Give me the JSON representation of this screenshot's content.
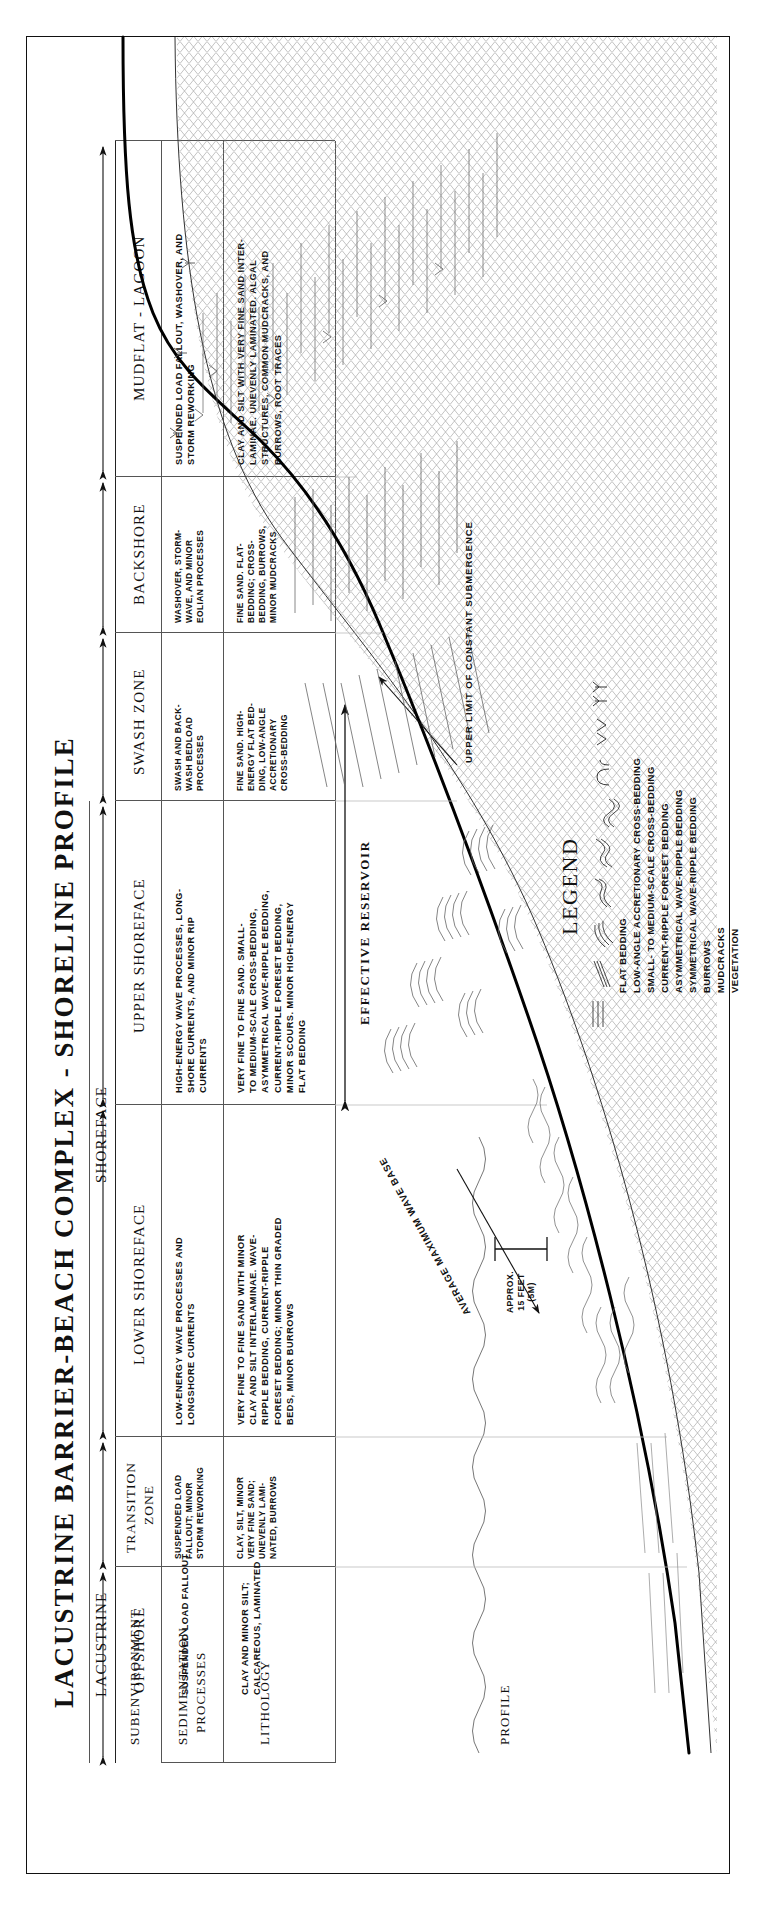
{
  "title": "LACUSTRINE BARRIER-BEACH COMPLEX - SHORELINE PROFILE",
  "row_labels": {
    "subenvironment": "SUBENVIRONMENT",
    "sedimentation_line1": "SEDIMENTATION",
    "sedimentation_line2": "PROCESSES",
    "lithology": "LITHOLOGY",
    "profile": "PROFILE"
  },
  "group_headers": {
    "lacustrine": "LACUSTRINE",
    "shoreface": "SHOREFACE"
  },
  "columns": [
    {
      "id": "offshore",
      "subenvironment": "OFFSHORE",
      "processes": [
        "SUSPENDED LOAD FALLOUT"
      ],
      "lithology": [
        "CLAY AND MINOR SILT;",
        "CALCAREOUS, LAMINATED"
      ]
    },
    {
      "id": "transition-zone",
      "subenvironment": "TRANSITION\nZONE",
      "processes": [
        "SUSPENDED LOAD",
        "FALLOUT; MINOR",
        "STORM REWORKING"
      ],
      "lithology": [
        "CLAY, SILT, MINOR",
        "VERY FINE SAND;",
        "UNEVENLY LAMI-",
        "NATED, BURROWS"
      ]
    },
    {
      "id": "lower-shoreface",
      "subenvironment": "LOWER SHOREFACE",
      "processes": [
        "LOW-ENERGY WAVE PROCESSES AND",
        "LONGSHORE CURRENTS"
      ],
      "lithology": [
        "VERY FINE TO FINE SAND WITH MINOR",
        "CLAY AND SILT INTERLAMINAE. WAVE-",
        "RIPPLE BEDDING, CURRENT-RIPPLE",
        "FORESET BEDDING; MINOR THIN GRADED",
        "BEDS, MINOR BURROWS"
      ]
    },
    {
      "id": "upper-shoreface",
      "subenvironment": "UPPER SHOREFACE",
      "processes": [
        "HIGH-ENERGY WAVE PROCESSES, LONG-",
        "SHORE CURRENTS, AND MINOR RIP",
        "CURRENTS"
      ],
      "lithology": [
        "VERY FINE TO FINE SAND. SMALL-",
        "TO MEDIUM-SCALE CROSS-BEDDING,",
        "ASYMMETRICAL WAVE-RIPPLE BEDDING,",
        "CURRENT-RIPPLE FORESET BEDDING,",
        "MINOR SCOURS. MINOR HIGH-ENERGY",
        "FLAT BEDDING"
      ]
    },
    {
      "id": "swash-zone",
      "subenvironment": "SWASH ZONE",
      "processes": [
        "SWASH AND BACK-",
        "WASH BEDLOAD",
        "PROCESSES"
      ],
      "lithology": [
        "FINE SAND. HIGH-",
        "ENERGY FLAT BED-",
        "DING, LOW-ANGLE",
        "ACCRETIONARY",
        "CROSS-BEDDING"
      ]
    },
    {
      "id": "backshore",
      "subenvironment": "BACKSHORE",
      "processes": [
        "WASHOVER, STORM-",
        "WAVE, AND MINOR",
        "EOLIAN PROCESSES"
      ],
      "lithology": [
        "FINE SAND. FLAT-",
        "BEDDING; CROSS-",
        "BEDDING, BURROWS,",
        "MINOR MUDCRACKS"
      ]
    },
    {
      "id": "mudflat-lagoon",
      "subenvironment": "MUDFLAT - LAGOON",
      "processes": [
        "SUSPENDED LOAD FALLOUT, WASHOVER, AND",
        "STORM REWORKING"
      ],
      "lithology": [
        "CLAY AND SILT WITH VERY FINE SAND INTER-",
        "LAMINAE. UNEVENLY LAMINATED. ALGAL",
        "STRUCTURES, COMMON MUDCRACKS, AND",
        "BURROWS, ROOT TRACES"
      ]
    }
  ],
  "annotations": {
    "effective_reservoir": "EFFECTIVE RESERVOIR",
    "upper_limit": "UPPER LIMIT OF CONSTANT SUBMERGENCE",
    "average_wave_base": "AVERAGE MAXIMUM WAVE BASE"
  },
  "scale": {
    "line1": "APPROX.",
    "line2": "15 FEET",
    "line3": "(5M)"
  },
  "legend": {
    "title": "LEGEND",
    "items": [
      {
        "symbol": "flat-bedding",
        "label": "FLAT BEDDING"
      },
      {
        "symbol": "low-angle-accretionary-cross-bedding",
        "label": "LOW-ANGLE ACCRETIONARY CROSS-BEDDING"
      },
      {
        "symbol": "small-to-medium-scale-cross-bedding",
        "label": "SMALL- TO MEDIUM-SCALE CROSS-BEDDING"
      },
      {
        "symbol": "current-ripple-foreset-bedding",
        "label": "CURRENT-RIPPLE FORESET BEDDING"
      },
      {
        "symbol": "asymmetrical-wave-ripple-bedding",
        "label": "ASYMMETRICAL WAVE-RIPPLE BEDDING"
      },
      {
        "symbol": "symmetrical-wave-ripple-bedding",
        "label": "SYMMETRICAL WAVE-RIPPLE BEDDING"
      },
      {
        "symbol": "burrows",
        "label": "BURROWS"
      },
      {
        "symbol": "mudcracks",
        "label": "MUDCRACKS"
      },
      {
        "symbol": "vegetation",
        "label": "VEGETATION"
      }
    ]
  },
  "colors": {
    "ink": "#111111",
    "rule": "#555555",
    "paper": "#ffffff"
  }
}
